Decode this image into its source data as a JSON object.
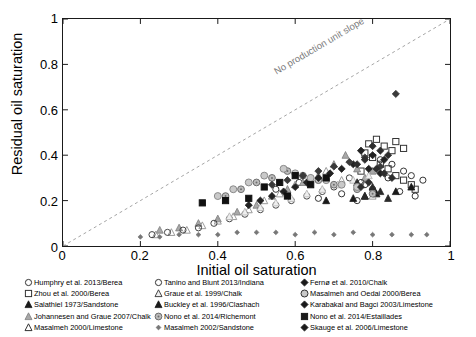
{
  "chart_data": {
    "type": "scatter",
    "title": "",
    "xlabel": "Initial oil saturation",
    "ylabel": "Residual oil saturation",
    "xlim": [
      0,
      1
    ],
    "ylim": [
      0,
      1
    ],
    "xticks": [
      "0",
      "0.2",
      "0.4",
      "0.6",
      "0.8",
      "1"
    ],
    "yticks": [
      "0",
      "0.2",
      "0.4",
      "0.6",
      "0.8",
      "1"
    ],
    "xtick_values": [
      0,
      0.2,
      0.4,
      0.6,
      0.8,
      1
    ],
    "ytick_values": [
      0,
      0.2,
      0.4,
      0.6,
      0.8,
      1
    ],
    "grid": false,
    "legend_position": "below-plot-three-columns",
    "annotations": [
      {
        "text": "No production unit slope",
        "x": 0.62,
        "y": 0.69,
        "style": "dashed unit-slope line y = x, gray",
        "line": {
          "from": [
            0,
            0
          ],
          "to": [
            1,
            1
          ],
          "dash": "3,3",
          "color": "#9a9a9a"
        }
      }
    ],
    "series": [
      {
        "name": "Humphry et al. 2013/Berea",
        "marker": "open-circle",
        "color": "#333333",
        "points": [
          [
            0.82,
            0.38
          ],
          [
            0.85,
            0.36
          ],
          [
            0.88,
            0.33
          ],
          [
            0.9,
            0.31
          ],
          [
            0.93,
            0.29
          ],
          [
            0.84,
            0.3
          ],
          [
            0.61,
            0.28
          ],
          [
            0.55,
            0.25
          ],
          [
            0.78,
            0.27
          ],
          [
            0.8,
            0.25
          ],
          [
            0.87,
            0.24
          ],
          [
            0.91,
            0.22
          ],
          [
            0.66,
            0.21
          ],
          [
            0.72,
            0.23
          ],
          [
            0.76,
            0.2
          ]
        ]
      },
      {
        "name": "Zhou et al. 2000/Berea",
        "marker": "open-square",
        "color": "#333333",
        "points": [
          [
            0.79,
            0.45
          ],
          [
            0.81,
            0.47
          ],
          [
            0.83,
            0.44
          ],
          [
            0.85,
            0.42
          ],
          [
            0.86,
            0.46
          ],
          [
            0.88,
            0.43
          ],
          [
            0.78,
            0.41
          ],
          [
            0.8,
            0.39
          ],
          [
            0.82,
            0.36
          ],
          [
            0.84,
            0.34
          ],
          [
            0.86,
            0.31
          ],
          [
            0.88,
            0.29
          ],
          [
            0.9,
            0.27
          ],
          [
            0.91,
            0.25
          ],
          [
            0.77,
            0.33
          ]
        ]
      },
      {
        "name": "Salathiel 1973/Sandstone",
        "marker": "filled-triangle",
        "color": "#1a1a1a",
        "points": [
          [
            0.81,
            0.23
          ],
          [
            0.86,
            0.24
          ],
          [
            0.9,
            0.26
          ],
          [
            0.75,
            0.21
          ],
          [
            0.68,
            0.2
          ],
          [
            0.78,
            0.22
          ]
        ]
      },
      {
        "name": "Johannesen and Graue 2007/Chalk",
        "marker": "gray-triangle",
        "color": "#8c8c8c",
        "points": [
          [
            0.73,
            0.4
          ],
          [
            0.7,
            0.36
          ],
          [
            0.76,
            0.34
          ],
          [
            0.66,
            0.31
          ],
          [
            0.62,
            0.28
          ],
          [
            0.78,
            0.3
          ],
          [
            0.8,
            0.33
          ],
          [
            0.58,
            0.25
          ],
          [
            0.54,
            0.22
          ],
          [
            0.5,
            0.18
          ],
          [
            0.45,
            0.15
          ],
          [
            0.4,
            0.12
          ],
          [
            0.35,
            0.1
          ],
          [
            0.3,
            0.08
          ],
          [
            0.25,
            0.07
          ]
        ]
      },
      {
        "name": "Masalmeh 2000/Limestone",
        "marker": "open-triangle",
        "color": "#9a9a9a",
        "points": [
          [
            0.68,
            0.33
          ],
          [
            0.64,
            0.3
          ],
          [
            0.6,
            0.27
          ],
          [
            0.56,
            0.23
          ],
          [
            0.52,
            0.2
          ],
          [
            0.48,
            0.16
          ],
          [
            0.44,
            0.13
          ],
          [
            0.4,
            0.11
          ],
          [
            0.36,
            0.09
          ],
          [
            0.32,
            0.07
          ],
          [
            0.28,
            0.06
          ],
          [
            0.24,
            0.05
          ],
          [
            0.72,
            0.29
          ],
          [
            0.76,
            0.26
          ],
          [
            0.8,
            0.22
          ]
        ]
      },
      {
        "name": "Tanino and Blunt 2013/Indiana",
        "marker": "open-circle",
        "color": "#444444",
        "points": [
          [
            0.74,
            0.3
          ],
          [
            0.77,
            0.28
          ],
          [
            0.7,
            0.26
          ],
          [
            0.67,
            0.24
          ],
          [
            0.63,
            0.22
          ],
          [
            0.59,
            0.2
          ],
          [
            0.55,
            0.18
          ],
          [
            0.51,
            0.16
          ],
          [
            0.47,
            0.14
          ],
          [
            0.43,
            0.12
          ],
          [
            0.39,
            0.1
          ],
          [
            0.35,
            0.08
          ],
          [
            0.31,
            0.07
          ],
          [
            0.27,
            0.06
          ],
          [
            0.23,
            0.05
          ]
        ]
      },
      {
        "name": "Graue et al. 1999/Chalk",
        "marker": "open-triangle-light",
        "color": "#b5b5b5",
        "points": [
          [
            0.79,
            0.31
          ],
          [
            0.75,
            0.29
          ],
          [
            0.71,
            0.27
          ],
          [
            0.67,
            0.25
          ],
          [
            0.63,
            0.23
          ],
          [
            0.59,
            0.21
          ],
          [
            0.55,
            0.19
          ],
          [
            0.51,
            0.17
          ],
          [
            0.47,
            0.15
          ],
          [
            0.43,
            0.13
          ]
        ]
      },
      {
        "name": "Buckley et al. 1996/Clashach",
        "marker": "filled-triangle",
        "color": "#2a2a2a",
        "points": [
          [
            0.8,
            0.26
          ],
          [
            0.82,
            0.24
          ],
          [
            0.78,
            0.22
          ],
          [
            0.76,
            0.28
          ],
          [
            0.84,
            0.21
          ]
        ]
      },
      {
        "name": "Nono et al. 2014/Richemont",
        "marker": "circle-dot",
        "color": "#6e6e6e",
        "points": [
          [
            0.58,
            0.33
          ],
          [
            0.62,
            0.31
          ],
          [
            0.66,
            0.29
          ],
          [
            0.7,
            0.27
          ],
          [
            0.54,
            0.3
          ],
          [
            0.5,
            0.28
          ],
          [
            0.46,
            0.25
          ],
          [
            0.42,
            0.22
          ],
          [
            0.76,
            0.25
          ],
          [
            0.8,
            0.23
          ]
        ]
      },
      {
        "name": "Masalmeh 2002/Sandstone",
        "marker": "small-diamond",
        "color": "#777777",
        "points": [
          [
            0.2,
            0.04
          ],
          [
            0.25,
            0.04
          ],
          [
            0.3,
            0.05
          ],
          [
            0.35,
            0.05
          ],
          [
            0.4,
            0.05
          ],
          [
            0.45,
            0.06
          ],
          [
            0.5,
            0.06
          ],
          [
            0.55,
            0.06
          ],
          [
            0.6,
            0.05
          ],
          [
            0.65,
            0.06
          ],
          [
            0.7,
            0.05
          ],
          [
            0.75,
            0.06
          ],
          [
            0.8,
            0.05
          ],
          [
            0.85,
            0.05
          ],
          [
            0.9,
            0.05
          ],
          [
            0.94,
            0.05
          ]
        ]
      },
      {
        "name": "Fernø et al. 2010/Chalk",
        "marker": "filled-diamond",
        "color": "#222222",
        "points": [
          [
            0.77,
            0.42
          ],
          [
            0.8,
            0.4
          ],
          [
            0.83,
            0.38
          ],
          [
            0.75,
            0.36
          ],
          [
            0.72,
            0.34
          ],
          [
            0.69,
            0.32
          ],
          [
            0.66,
            0.3
          ],
          [
            0.63,
            0.28
          ],
          [
            0.6,
            0.26
          ],
          [
            0.57,
            0.24
          ],
          [
            0.54,
            0.22
          ],
          [
            0.51,
            0.2
          ],
          [
            0.48,
            0.18
          ],
          [
            0.79,
            0.34
          ],
          [
            0.82,
            0.32
          ]
        ]
      },
      {
        "name": "Masalmeh and Oedai 2000/Berea",
        "marker": "open-circle-gray",
        "color": "#8a8a8a",
        "points": [
          [
            0.57,
            0.34
          ],
          [
            0.6,
            0.32
          ],
          [
            0.64,
            0.3
          ],
          [
            0.52,
            0.31
          ],
          [
            0.48,
            0.28
          ],
          [
            0.68,
            0.29
          ],
          [
            0.72,
            0.27
          ],
          [
            0.44,
            0.25
          ],
          [
            0.76,
            0.26
          ],
          [
            0.4,
            0.22
          ]
        ]
      },
      {
        "name": "Karabakal and Bagci 2003/Limestone",
        "marker": "filled-diamond",
        "color": "#3a3a3a",
        "points": [
          [
            0.86,
            0.67
          ],
          [
            0.78,
            0.39
          ],
          [
            0.74,
            0.37
          ],
          [
            0.7,
            0.35
          ],
          [
            0.82,
            0.35
          ],
          [
            0.66,
            0.33
          ],
          [
            0.62,
            0.31
          ],
          [
            0.58,
            0.29
          ],
          [
            0.54,
            0.27
          ]
        ]
      },
      {
        "name": "Nono et al. 2014/Estaillades",
        "marker": "filled-square",
        "color": "#111111",
        "points": [
          [
            0.36,
            0.19
          ],
          [
            0.42,
            0.2
          ],
          [
            0.48,
            0.21
          ],
          [
            0.52,
            0.26
          ],
          [
            0.56,
            0.28
          ],
          [
            0.6,
            0.31
          ],
          [
            0.64,
            0.27
          ],
          [
            0.68,
            0.3
          ],
          [
            0.58,
            0.22
          ]
        ]
      },
      {
        "name": "Skauge et al. 2006/Limestone",
        "marker": "filled-diamond",
        "color": "#2e2e2e",
        "points": [
          [
            0.8,
            0.44
          ],
          [
            0.82,
            0.42
          ],
          [
            0.84,
            0.4
          ],
          [
            0.78,
            0.38
          ],
          [
            0.76,
            0.36
          ],
          [
            0.81,
            0.34
          ],
          [
            0.83,
            0.32
          ],
          [
            0.85,
            0.3
          ],
          [
            0.79,
            0.28
          ],
          [
            0.77,
            0.26
          ]
        ]
      }
    ]
  },
  "axes": {
    "x_title": "Initial oil saturation",
    "y_title": "Residual oil saturation",
    "x_ticks": [
      "0",
      "0.2",
      "0.4",
      "0.6",
      "0.8",
      "1"
    ],
    "y_ticks": [
      "0",
      "0.2",
      "0.4",
      "0.6",
      "0.8",
      "1"
    ]
  },
  "annotation": {
    "slope_text": "No production unit slope"
  },
  "legend": {
    "columns": [
      {
        "items": [
          {
            "marker": "open-circle",
            "label": "Humphry et al. 2013/Berea"
          },
          {
            "marker": "open-square",
            "label": "Zhou et al. 2000/Berea"
          },
          {
            "marker": "filled-triangle",
            "label": "Salathiel  1973/Sandstone"
          },
          {
            "marker": "gray-triangle",
            "label": "Johannesen and Graue 2007/Chalk"
          },
          {
            "marker": "open-triangle",
            "label": "Masalmeh 2000/Limestone"
          }
        ]
      },
      {
        "items": [
          {
            "marker": "open-circle",
            "label": "Tanino and Blunt 2013/Indiana"
          },
          {
            "marker": "open-triangle-light",
            "label": "Graue et al. 1999/Chalk"
          },
          {
            "marker": "filled-triangle",
            "label": "Buckley et al. 1996/Clashach"
          },
          {
            "marker": "circle-dot",
            "label": "Nono et al. 2014/Richemont"
          },
          {
            "marker": "small-diamond",
            "label": "Masalmeh 2002/Sandstone"
          }
        ]
      },
      {
        "items": [
          {
            "marker": "filled-diamond",
            "label": "Fernø et al. 2010/Chalk"
          },
          {
            "marker": "open-circle-gray",
            "label": "Masalmeh and Oedai 2000/Berea"
          },
          {
            "marker": "filled-diamond",
            "label": "Karabakal and Bagci 2003/Limestone"
          },
          {
            "marker": "filled-square",
            "label": "Nono et al. 2014/Estaillades"
          },
          {
            "marker": "filled-diamond",
            "label": "Skauge et al. 2006/Limestone"
          }
        ]
      }
    ]
  },
  "colors": {
    "axis": "#1a1a1a",
    "slope_line": "#9a9a9a",
    "slope_text": "#7a7a7a"
  }
}
